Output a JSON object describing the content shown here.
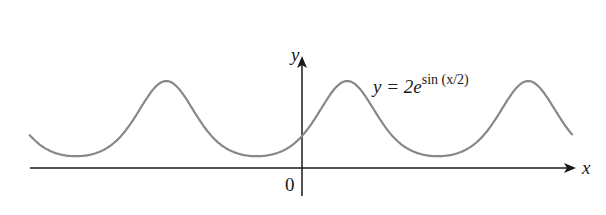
{
  "chart_data": {
    "type": "line",
    "title": "",
    "equation": {
      "lhs": "y = 2e",
      "exponent": "sin (x/2)"
    },
    "xlabel": "x",
    "ylabel": "y",
    "origin_label": "0",
    "series": [
      {
        "name": "y = 2e^{sin(x/2)}",
        "function": "2*exp(sin(x/2))",
        "period": 12.566,
        "max": 5.437,
        "min": 0.736,
        "y_at_0": 2,
        "x_range": [
          -18.9,
          18.75
        ],
        "color": "#888888"
      }
    ],
    "xlim": [
      -19.5,
      19.2
    ],
    "ylim": [
      -2.8,
      8
    ],
    "grid": false,
    "axis_color": "#1a1a1a",
    "curve_color": "#888888"
  },
  "labels": {
    "x_axis": "x",
    "y_axis": "y",
    "origin": "0",
    "equation_main": "y = 2e",
    "equation_sup": "sin (x/2)"
  }
}
